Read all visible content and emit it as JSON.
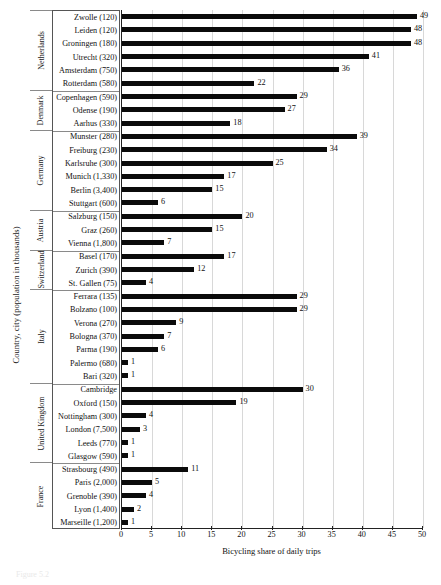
{
  "chart_data": {
    "type": "bar",
    "orientation": "horizontal",
    "title": "",
    "xlabel": "Bicycling share of daily trips",
    "ylabel": "Country, city (population in thousands)",
    "xlim": [
      0,
      50
    ],
    "xticks": [
      0,
      5,
      10,
      15,
      20,
      25,
      30,
      35,
      40,
      45,
      50
    ],
    "grid": "vertical",
    "legend": "none",
    "bar_color": "#0b0b0b",
    "groups": [
      {
        "country": "Netherlands",
        "categories": [
          "Zwolle (120)",
          "Leiden (120)",
          "Groningen (180)",
          "Utrecht (320)",
          "Amsterdam (750)",
          "Rotterdam (580)"
        ],
        "values": [
          49,
          48,
          48,
          41,
          36,
          22
        ]
      },
      {
        "country": "Denmark",
        "categories": [
          "Copenhagen (590)",
          "Odense (190)",
          "Aarhus (330)"
        ],
        "values": [
          29,
          27,
          18
        ]
      },
      {
        "country": "Germany",
        "categories": [
          "Munster (280)",
          "Freiburg (230)",
          "Karlsruhe (300)",
          "Munich (1,330)",
          "Berlin (3,400)",
          "Stuttgart (600)"
        ],
        "values": [
          39,
          34,
          25,
          17,
          15,
          6
        ]
      },
      {
        "country": "Austria",
        "categories": [
          "Salzburg (150)",
          "Graz (260)",
          "Vienna (1,800)"
        ],
        "values": [
          20,
          15,
          7
        ]
      },
      {
        "country": "Switzerland",
        "categories": [
          "Basel (170)",
          "Zurich (390)",
          "St. Gallen (75)"
        ],
        "values": [
          17,
          12,
          4
        ]
      },
      {
        "country": "Italy",
        "categories": [
          "Ferrara (135)",
          "Bolzano (100)",
          "Verona (270)",
          "Bologna (370)",
          "Parma (190)",
          "Palermo (680)",
          "Bari (320)"
        ],
        "values": [
          29,
          29,
          9,
          7,
          6,
          1,
          1
        ]
      },
      {
        "country": "United Kingdom",
        "categories": [
          "Cambridge",
          "Oxford (150)",
          "Nottingham (300)",
          "London (7,500)",
          "Leeds (770)",
          "Glasgow (590)"
        ],
        "values": [
          30,
          19,
          4,
          3,
          1,
          1
        ]
      },
      {
        "country": "France",
        "categories": [
          "Strasbourg (490)",
          "Paris (2,000)",
          "Grenoble (390)",
          "Lyon (1,400)",
          "Marseille (1,200)"
        ],
        "values": [
          11,
          5,
          4,
          2,
          1
        ]
      }
    ]
  },
  "figure": {
    "caption": "Figure 5.2"
  }
}
